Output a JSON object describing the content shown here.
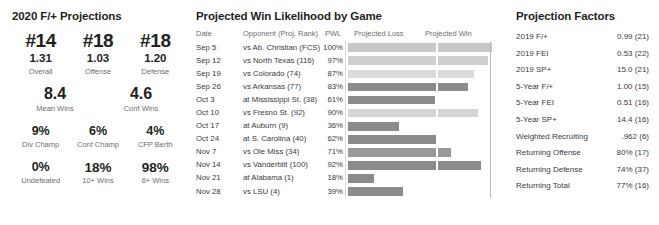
{
  "left": {
    "title": "2020 F/+ Projections",
    "ranks": [
      {
        "rank": "#14",
        "value": "1.31",
        "label": "Overall"
      },
      {
        "rank": "#18",
        "value": "1.03",
        "label": "Offense"
      },
      {
        "rank": "#18",
        "value": "1.20",
        "label": "Defense"
      }
    ],
    "wins": [
      {
        "value": "8.4",
        "label": "Mean Wins"
      },
      {
        "value": "4.6",
        "label": "Conf Wins"
      }
    ],
    "pct_row1": [
      {
        "value": "9%",
        "label": "Div Champ"
      },
      {
        "value": "6%",
        "label": "Conf Champ"
      },
      {
        "value": "4%",
        "label": "CFP Berth"
      }
    ],
    "pct_row2": [
      {
        "value": "0%",
        "label": "Undefeated"
      },
      {
        "value": "18%",
        "label": "10+ Wins"
      },
      {
        "value": "98%",
        "label": "6+ Wins"
      }
    ]
  },
  "middle": {
    "title": "Projected Win Likelihood by Game",
    "headers": {
      "date": "Date",
      "opponent": "Opponent (Proj. Rank)",
      "pwl": "PWL",
      "projected_loss": "Projected Loss",
      "projected_win": "Projected Win"
    }
  },
  "right": {
    "title": "Projection Factors",
    "rows": [
      {
        "label": "2019 F/+",
        "value": "0.99 (21)"
      },
      {
        "label": "2019 FEI",
        "value": "0.53 (22)"
      },
      {
        "label": "2019 SP+",
        "value": "15.0 (21)"
      },
      {
        "label": "5-Year F/+",
        "value": "1.00 (15)"
      },
      {
        "label": "5-Year FEI",
        "value": "0.51 (16)"
      },
      {
        "label": "5-Year SP+",
        "value": "14.4 (16)"
      },
      {
        "label": "Weighted Recruiting",
        "value": ".962 (6)"
      },
      {
        "label": "Returning Offense",
        "value": "80% (17)"
      },
      {
        "label": "Returning Defense",
        "value": "74% (37)"
      },
      {
        "label": "Returning Total",
        "value": "77% (16)"
      }
    ]
  },
  "chart_data": {
    "type": "bar",
    "title": "Projected Win Likelihood by Game",
    "xlabel": "",
    "ylabel": "",
    "xlim": [
      0,
      100
    ],
    "grid": false,
    "legend": [
      "Projected Loss",
      "Projected Win"
    ],
    "legend_position": "top",
    "columns": [
      "Date",
      "Opponent (Proj. Rank)",
      "PWL",
      "Projected Loss",
      "Projected Win"
    ],
    "categories": [
      "Sep 5 vs Ab. Christian (FCS)",
      "Sep 12 vs North Texas (116)",
      "Sep 19 vs Colorado (74)",
      "Sep 26 vs Arkansas (77)",
      "Oct 3 at Mississippi St. (38)",
      "Oct 10 vs Fresno St. (92)",
      "Oct 17 at Auburn (9)",
      "Oct 24 at S. Carolina (40)",
      "Nov 7 vs Ole Miss (34)",
      "Nov 14 vs Vanderbilt (100)",
      "Nov 21 at Alabama (1)",
      "Nov 28 vs LSU (4)"
    ],
    "values": [
      100,
      97,
      87,
      83,
      61,
      90,
      36,
      62,
      71,
      92,
      18,
      39
    ],
    "rows": [
      {
        "date": "Sep 5",
        "opponent": "vs Ab. Christian (FCS)",
        "pwl": "100%",
        "pwl_value": 100,
        "shade": "#c8c8c8"
      },
      {
        "date": "Sep 12",
        "opponent": "vs North Texas (116)",
        "pwl": "97%",
        "pwl_value": 97,
        "shade": "#cfcfcf"
      },
      {
        "date": "Sep 19",
        "opponent": "vs Colorado (74)",
        "pwl": "87%",
        "pwl_value": 87,
        "shade": "#dadada"
      },
      {
        "date": "Sep 26",
        "opponent": "vs Arkansas (77)",
        "pwl": "83%",
        "pwl_value": 83,
        "shade": "#8b8b8b"
      },
      {
        "date": "Oct 3",
        "opponent": "at Mississippi St. (38)",
        "pwl": "61%",
        "pwl_value": 61,
        "shade": "#8b8b8b"
      },
      {
        "date": "Oct 10",
        "opponent": "vs Fresno St. (92)",
        "pwl": "90%",
        "pwl_value": 90,
        "shade": "#d5d5d5"
      },
      {
        "date": "Oct 17",
        "opponent": "at Auburn (9)",
        "pwl": "36%",
        "pwl_value": 36,
        "shade": "#8b8b8b"
      },
      {
        "date": "Oct 24",
        "opponent": "at S. Carolina (40)",
        "pwl": "62%",
        "pwl_value": 62,
        "shade": "#8b8b8b"
      },
      {
        "date": "Nov 7",
        "opponent": "vs Ole Miss (34)",
        "pwl": "71%",
        "pwl_value": 71,
        "shade": "#999999"
      },
      {
        "date": "Nov 14",
        "opponent": "vs Vanderbilt (100)",
        "pwl": "92%",
        "pwl_value": 92,
        "shade": "#8b8b8b"
      },
      {
        "date": "Nov 21",
        "opponent": "at Alabama (1)",
        "pwl": "18%",
        "pwl_value": 18,
        "shade": "#8b8b8b"
      },
      {
        "date": "Nov 28",
        "opponent": "vs LSU (4)",
        "pwl": "39%",
        "pwl_value": 39,
        "shade": "#8b8b8b"
      }
    ]
  }
}
